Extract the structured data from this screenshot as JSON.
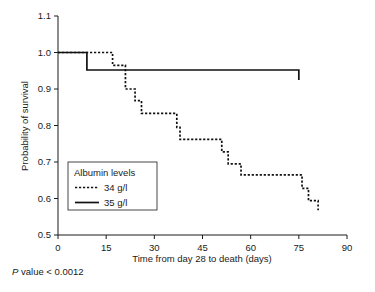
{
  "figure": {
    "pvalue_prefix": "P",
    "pvalue_text": " value < 0.0012"
  },
  "legend": {
    "title": "Albumin levels",
    "entries": [
      {
        "label": "34 g/l",
        "style": "dotted"
      },
      {
        "label": "35 g/l",
        "style": "solid"
      }
    ]
  },
  "chart_data": {
    "type": "line",
    "title": "",
    "subtitle": "",
    "xlabel": "Time from day 28 to death (days)",
    "ylabel": "Probability of survival",
    "xlim": [
      0,
      90
    ],
    "ylim": [
      0.5,
      1.1
    ],
    "xticks": [
      0,
      15,
      30,
      45,
      60,
      75,
      90
    ],
    "xtick_labels": [
      "0",
      "15",
      "30",
      "45",
      "60",
      "75",
      "90"
    ],
    "yticks": [
      0.5,
      0.6,
      0.7,
      0.8,
      0.9,
      1.0,
      1.1
    ],
    "ytick_labels": [
      "0.5",
      "0.6",
      "0.7",
      "0.8",
      "0.9",
      "1.0",
      "1.1"
    ],
    "grid": false,
    "legend_position": "inside-lower-left",
    "annotation": "P value < 0.0012",
    "series": [
      {
        "name": "34 g/l",
        "style": "dotted",
        "step": "post",
        "points": [
          [
            0,
            1.0
          ],
          [
            17,
            1.0
          ],
          [
            17,
            0.965
          ],
          [
            21,
            0.965
          ],
          [
            21,
            0.9
          ],
          [
            24,
            0.9
          ],
          [
            24,
            0.868
          ],
          [
            26,
            0.868
          ],
          [
            26,
            0.833
          ],
          [
            37,
            0.833
          ],
          [
            37,
            0.795
          ],
          [
            38,
            0.795
          ],
          [
            38,
            0.762
          ],
          [
            51,
            0.762
          ],
          [
            51,
            0.728
          ],
          [
            53,
            0.728
          ],
          [
            53,
            0.695
          ],
          [
            57,
            0.695
          ],
          [
            57,
            0.665
          ],
          [
            76,
            0.665
          ],
          [
            76,
            0.628
          ],
          [
            78,
            0.628
          ],
          [
            78,
            0.594
          ],
          [
            81,
            0.594
          ],
          [
            81,
            0.568
          ]
        ]
      },
      {
        "name": "35 g/l",
        "style": "solid",
        "step": "post",
        "points": [
          [
            0,
            1.0
          ],
          [
            9,
            1.0
          ],
          [
            9,
            0.952
          ],
          [
            75,
            0.952
          ],
          [
            75,
            0.925
          ]
        ]
      }
    ]
  }
}
